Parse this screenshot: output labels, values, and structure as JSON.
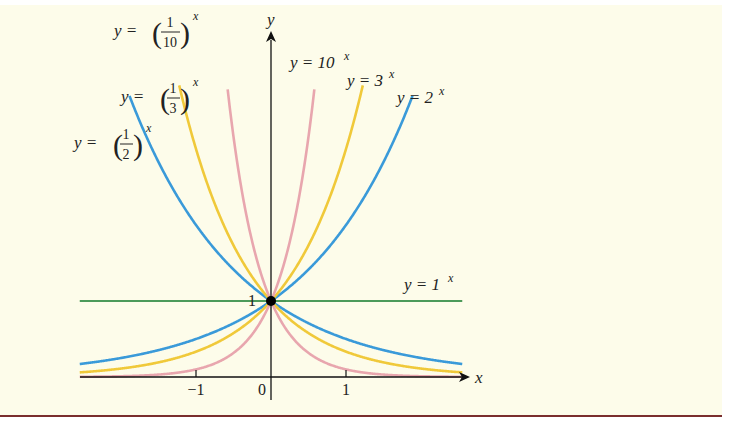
{
  "chart_data": {
    "type": "line",
    "title": "",
    "xlabel": "x",
    "ylabel": "y",
    "x_ticks": [
      "-1",
      "0",
      "1"
    ],
    "y_ticks": [
      "1"
    ],
    "xlim": [
      -2.55,
      2.5
    ],
    "ylim": [
      0,
      3.9
    ],
    "grid": false,
    "legend": "inline curve labels",
    "annotations": [
      "point (0, 1) marked with filled dot"
    ],
    "series": [
      {
        "name": "y = (1/2)^x",
        "base": 0.5,
        "color": "#3a9ad9",
        "x_range": [
          -2.5,
          2.5
        ]
      },
      {
        "name": "y = (1/3)^x",
        "base": 0.3333,
        "color": "#f0c93a",
        "x_range": [
          -2.5,
          2.5
        ]
      },
      {
        "name": "y = (1/10)^x",
        "base": 0.1,
        "color": "#e8a6ae",
        "x_range": [
          -2.5,
          2.5
        ]
      },
      {
        "name": "y = 1^x",
        "base": 1,
        "color": "#4c9a5a",
        "x_range": [
          -2.55,
          2.55
        ]
      },
      {
        "name": "y = 2^x",
        "base": 2,
        "color": "#3a9ad9",
        "x_range": [
          -2.5,
          2.5
        ]
      },
      {
        "name": "y = 3^x",
        "base": 3,
        "color": "#f0c93a",
        "x_range": [
          -2.5,
          2.5
        ]
      },
      {
        "name": "y = 10^x",
        "base": 10,
        "color": "#e8a6ae",
        "x_range": [
          -2.5,
          2.5
        ]
      }
    ]
  },
  "labels": {
    "x_axis": "x",
    "y_axis": "y",
    "tick_neg1": "−1",
    "tick_0": "0",
    "tick_1": "1",
    "tick_y1": "1",
    "half": {
      "lhs": "y =",
      "num": "1",
      "den": "2",
      "exp": "x"
    },
    "third": {
      "lhs": "y =",
      "num": "1",
      "den": "3",
      "exp": "x"
    },
    "tenth": {
      "lhs": "y =",
      "num": "1",
      "den": "10",
      "exp": "x"
    },
    "ten": {
      "lhs": "y = 10",
      "exp": "x"
    },
    "three": {
      "lhs": "y = 3",
      "exp": "x"
    },
    "two": {
      "lhs": "y = 2",
      "exp": "x"
    },
    "one": {
      "lhs": "y = 1",
      "exp": "x"
    }
  },
  "colors": {
    "background": "#fdfcea",
    "bottom_rule": "#7a2e2e",
    "blue": "#3a9ad9",
    "yellow": "#f0c93a",
    "pink": "#e8a6ae",
    "green": "#4c9a5a"
  }
}
